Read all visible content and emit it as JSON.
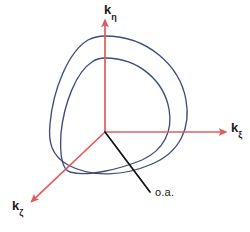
{
  "figure": {
    "background_color": "#ffffff",
    "width": 250,
    "height": 232
  },
  "colors": {
    "axis": "#e05c5c",
    "curve": "#3f4d7a",
    "optical_axis": "#111111",
    "text": "#1a1a1a"
  },
  "axes": {
    "origin": {
      "x": 105,
      "y": 132
    },
    "items": [
      {
        "id": "k-eta",
        "symbol": "k",
        "subscript": "η",
        "direction": "up",
        "tip": {
          "x": 105,
          "y": 18
        }
      },
      {
        "id": "k-xi",
        "symbol": "k",
        "subscript": "ξ",
        "direction": "right",
        "tip": {
          "x": 228,
          "y": 132
        }
      },
      {
        "id": "k-zeta",
        "symbol": "k",
        "subscript": "ζ",
        "direction": "down-left",
        "tip": {
          "x": 30,
          "y": 203
        }
      }
    ]
  },
  "optical_axis": {
    "label": "o.a.",
    "line_start": {
      "x": 105,
      "y": 132
    },
    "line_end": {
      "x": 150,
      "y": 192
    }
  },
  "chart_data": {
    "type": "line",
    "xlabel": "kξ",
    "ylabel": "kη",
    "zlabel": "kζ",
    "grid": false,
    "legend": null,
    "annotations": [
      {
        "text": "o.a.",
        "x": 150,
        "y": 192,
        "description": "optical axis direction"
      }
    ],
    "series": [
      {
        "name": "outer-wavevector-surface",
        "color": "#3f4d7a",
        "closed": true,
        "path": "M 105 36 C 148 36 180 66 186 100 C 191 128 180 152 152 164 C 124 176 92 178 68 165 C 52 156 48 143 50 124 C 53 90 68 52 88 40 C 94 37 100 36 105 36 Z"
      },
      {
        "name": "inner-wavevector-surface",
        "color": "#3f4d7a",
        "closed": true,
        "path": "M 105 58 C 140 58 164 82 169 109 C 173 131 164 150 142 160 C 120 169 88 177 70 172 C 60 169 60 149 61 133 C 64 104 76 72 92 62 C 96 59 100 58 105 58 Z"
      }
    ]
  }
}
